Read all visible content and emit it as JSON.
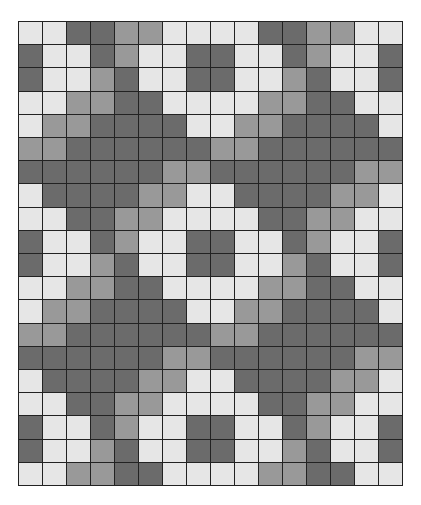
{
  "grid": {
    "columns": 16,
    "rows": 20,
    "palette": {
      "L": "#e6e6e6",
      "M": "#999999",
      "D": "#6b6b6b"
    },
    "line_color": "#222222",
    "cells": [
      "LLDDMMLLLLDDMMLL",
      "DLLDMLLDDLLDMLLD",
      "DLLMDLLDDLLMDLLD",
      "LLMMDDLLLLMMDDLL",
      "LMMDDDDLLMMDDDDL",
      "MMDDDDDDMMDDDDDD",
      "DDDDDDMMDDDDDDMM",
      "LDDDDMMLLDDDDMML",
      "LLDDMMLLLLDDMMLL",
      "DLLDMLLDDLLDMLLD",
      "DLLMDLLDDLLMDLLD",
      "LLMMDDLLLLMMDDLL",
      "LMMDDDDLLMMDDDDL",
      "MMDDDDDDMMDDDDDD",
      "DDDDDDMMDDDDDDMM",
      "LDDDDMMLLDDDDMML",
      "LLDDMMLLLLDDMMLL",
      "DLLDMLLDDLLDMLLD",
      "DLLMDLLDDLLMDLLD",
      "LLMMDDLLLLMMDDLL"
    ]
  }
}
